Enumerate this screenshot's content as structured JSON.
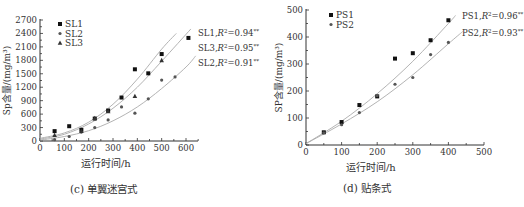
{
  "chart_data": [
    {
      "type": "scatter",
      "panel": "c",
      "caption": "(c) 单翼迷宫式",
      "xlabel": "运行时间/h",
      "ylabel": "Sp含量/(mg/m³)",
      "xlim": [
        0,
        650
      ],
      "ylim": [
        0,
        2700
      ],
      "xticks": [
        0,
        100,
        200,
        300,
        400,
        500,
        600
      ],
      "yticks": [
        0,
        300,
        600,
        900,
        1200,
        1500,
        1800,
        2100,
        2400,
        2700
      ],
      "legend": [
        "SL1",
        "SL2",
        "SL3"
      ],
      "legend_position": "top-left",
      "grid": false,
      "series": [
        {
          "name": "SL1",
          "marker": "square",
          "fit_label": "SL1,R²=0.94**",
          "x": [
            60,
            120,
            170,
            225,
            280,
            335,
            390,
            445,
            500,
            610
          ],
          "y": [
            220,
            330,
            250,
            500,
            680,
            970,
            1600,
            1510,
            1940,
            2300
          ],
          "fit": [
            [
              0,
              60
            ],
            [
              100,
              180
            ],
            [
              200,
              420
            ],
            [
              300,
              820
            ],
            [
              400,
              1380
            ],
            [
              500,
              2050
            ],
            [
              560,
              2400
            ]
          ]
        },
        {
          "name": "SL2",
          "marker": "dot",
          "fit_label": "SL2,R²=0.91**",
          "x": [
            60,
            120,
            170,
            225,
            280,
            335,
            390,
            445,
            500,
            555
          ],
          "y": [
            30,
            100,
            200,
            300,
            470,
            760,
            620,
            940,
            1360,
            1430
          ],
          "fit": [
            [
              0,
              20
            ],
            [
              100,
              100
            ],
            [
              200,
              230
            ],
            [
              300,
              450
            ],
            [
              400,
              760
            ],
            [
              500,
              1170
            ],
            [
              600,
              1650
            ],
            [
              640,
              1900
            ]
          ]
        },
        {
          "name": "SL3",
          "marker": "triangle",
          "fit_label": "SL3,R²=0.95**",
          "x": [
            60,
            170,
            225,
            280,
            390,
            500
          ],
          "y": [
            130,
            220,
            510,
            660,
            1000,
            1800
          ],
          "fit": [
            [
              0,
              40
            ],
            [
              100,
              150
            ],
            [
              200,
              380
            ],
            [
              300,
              730
            ],
            [
              400,
              1200
            ],
            [
              500,
              1780
            ],
            [
              620,
              2500
            ]
          ]
        }
      ]
    },
    {
      "type": "scatter",
      "panel": "d",
      "caption": "(d) 贴条式",
      "xlabel": "运行时间/h",
      "ylabel": "SP含量/(mg/m³)",
      "xlim": [
        0,
        500
      ],
      "ylim": [
        0,
        500
      ],
      "xticks": [
        0,
        100,
        200,
        300,
        400,
        500
      ],
      "yticks": [
        0,
        100,
        200,
        300,
        400,
        500
      ],
      "legend": [
        "PS1",
        "PS2"
      ],
      "legend_position": "top-left",
      "grid": false,
      "series": [
        {
          "name": "PS1",
          "marker": "square",
          "fit_label": "PS1,R²=0.96**",
          "x": [
            50,
            100,
            150,
            200,
            250,
            300,
            350,
            400
          ],
          "y": [
            47,
            85,
            148,
            180,
            320,
            340,
            388,
            462
          ],
          "fit": [
            [
              0,
              5
            ],
            [
              100,
              88
            ],
            [
              200,
              190
            ],
            [
              300,
              310
            ],
            [
              400,
              450
            ],
            [
              420,
              480
            ]
          ]
        },
        {
          "name": "PS2",
          "marker": "dot",
          "fit_label": "PS2,R²=0.93**",
          "x": [
            50,
            100,
            150,
            200,
            250,
            300,
            350,
            400
          ],
          "y": [
            45,
            75,
            120,
            183,
            225,
            250,
            335,
            380
          ],
          "fit": [
            [
              0,
              5
            ],
            [
              100,
              78
            ],
            [
              200,
              160
            ],
            [
              300,
              260
            ],
            [
              400,
              375
            ],
            [
              440,
              420
            ]
          ]
        }
      ]
    }
  ]
}
